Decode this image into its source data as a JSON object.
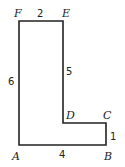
{
  "figure": {
    "type": "L-shaped polygon",
    "vertices": [
      {
        "name": "A",
        "label": "A"
      },
      {
        "name": "B",
        "label": "B"
      },
      {
        "name": "C",
        "label": "C"
      },
      {
        "name": "D",
        "label": "D"
      },
      {
        "name": "E",
        "label": "E"
      },
      {
        "name": "F",
        "label": "F"
      }
    ],
    "sides": [
      {
        "from": "A",
        "to": "B",
        "length": "4"
      },
      {
        "from": "B",
        "to": "C",
        "length": "1"
      },
      {
        "from": "D",
        "to": "E",
        "length": "5"
      },
      {
        "from": "E",
        "to": "F",
        "length": "2"
      },
      {
        "from": "F",
        "to": "A",
        "length": "6"
      }
    ]
  }
}
